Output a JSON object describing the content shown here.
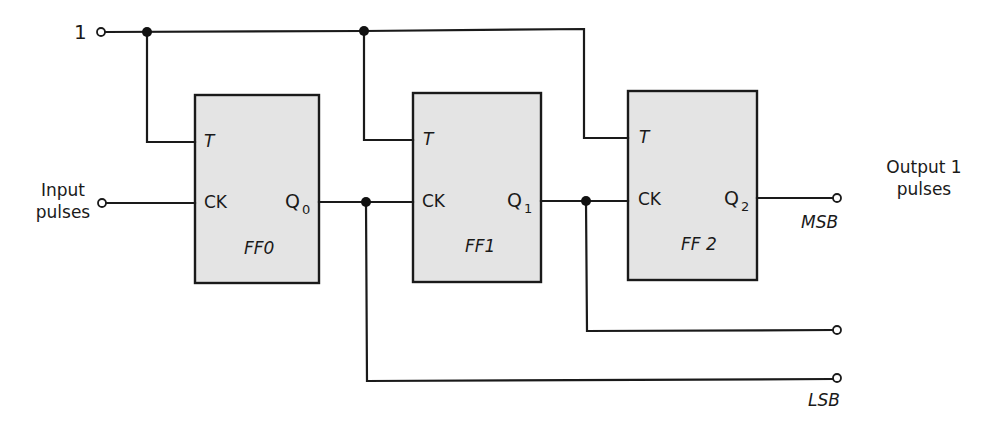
{
  "diagram": {
    "type": "3-bit ripple (asynchronous) binary counter using T flip-flops",
    "colors": {
      "wire": "#1a1a1a",
      "box_fill": "#e4e4e4",
      "background": "#ffffff"
    },
    "inputs": {
      "logic_high": {
        "label": "1"
      },
      "clock": {
        "label_line1": "Input",
        "label_line2": "pulses"
      }
    },
    "flip_flops": [
      {
        "name": "FF0",
        "t_label": "T",
        "ck_label": "CK",
        "q_label": "Q",
        "q_sub": "0"
      },
      {
        "name": "FF1",
        "t_label": "T",
        "ck_label": "CK",
        "q_label": "Q",
        "q_sub": "1"
      },
      {
        "name": "FF 2",
        "t_label": "T",
        "ck_label": "CK",
        "q_label": "Q",
        "q_sub": "2"
      }
    ],
    "outputs": {
      "msb_label": "MSB",
      "lsb_label": "LSB",
      "output_line1": "Output 1",
      "output_line2": "pulses"
    }
  }
}
